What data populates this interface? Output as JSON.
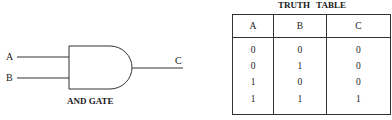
{
  "gate": {
    "type": "AND",
    "caption": "AND GATE",
    "inputs": [
      "A",
      "B"
    ],
    "output": "C"
  },
  "truth_table": {
    "title": "TRUTH TABLE",
    "headers": [
      "A",
      "B",
      "C"
    ],
    "rows": [
      [
        "0",
        "0",
        "0"
      ],
      [
        "0",
        "1",
        "0"
      ],
      [
        "1",
        "0",
        "0"
      ],
      [
        "1",
        "1",
        "1"
      ]
    ]
  },
  "colors": {
    "line": "#333333",
    "text": "#1a1a1a",
    "background": "#ffffff"
  }
}
